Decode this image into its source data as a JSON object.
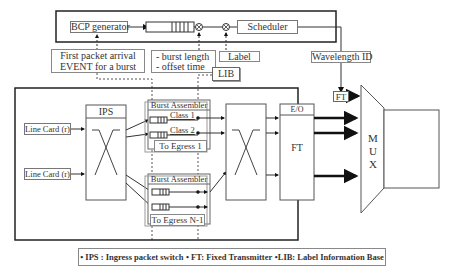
{
  "diagram": {
    "top_block": {
      "bcp_generator": "BCP generator",
      "scheduler": "Scheduler"
    },
    "annotations": {
      "first_packet": [
        "First packet arrival",
        "EVENT for a burst"
      ],
      "burst_info": [
        "- burst length",
        "- offset time"
      ],
      "label": "Label",
      "lib": "LIB",
      "wavelength_id": "Wavelength ID",
      "ft_small": "FT"
    },
    "ingress": {
      "line_cards": [
        "Line Card (r)",
        "Line Card (r)"
      ],
      "ips": "IPS",
      "burst_assembler_1": {
        "title": "Burst Assembler",
        "classes": [
          "Class 1",
          "Class 2"
        ],
        "egress": "To Egress 1"
      },
      "burst_assembler_n": {
        "title": "Burst Assembler",
        "egress": "To Egress N-1"
      },
      "eo": "E/O",
      "ft": "FT"
    },
    "mux": [
      "M",
      "U",
      "X"
    ]
  },
  "legend": [
    "• IPS : Ingress packet switch",
    "• FT: Fixed Transmitter",
    "•LIB: Label Information Base"
  ]
}
